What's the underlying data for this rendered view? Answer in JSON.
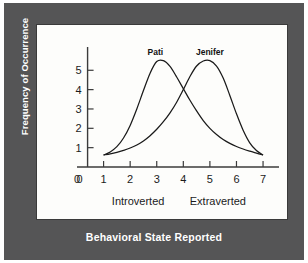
{
  "figure": {
    "title": "Behavioral State Reported",
    "panel_background": "#fdfdfb",
    "mount_color": "#555556",
    "title_color": "#ffffff"
  },
  "chart_data": {
    "type": "line",
    "title": "Behavioral State Reported",
    "xlabel": "Behavioral State Reported",
    "ylabel": "Frequency of Occurrence",
    "xlim": [
      0,
      7.6
    ],
    "ylim": [
      0,
      6.1
    ],
    "grid": false,
    "legend": "inline-labels-above-peaks",
    "xticks": [
      "0",
      "1",
      "2",
      "3",
      "4",
      "5",
      "6",
      "7"
    ],
    "xtick_values": [
      0,
      1,
      2,
      3,
      4,
      5,
      6,
      7
    ],
    "yticks": [
      "0",
      "1",
      "2",
      "3",
      "4",
      "5"
    ],
    "ytick_values": [
      0,
      1,
      2,
      3,
      4,
      5
    ],
    "x_category_labels": [
      {
        "text": "Introverted",
        "at_x": 2.3
      },
      {
        "text": "Extraverted",
        "at_x": 5.3
      }
    ],
    "x": [
      1.0,
      1.25,
      1.5,
      1.75,
      2.0,
      2.25,
      2.5,
      2.75,
      3.0,
      3.25,
      3.5,
      3.75,
      4.0,
      4.25,
      4.5,
      4.75,
      5.0,
      5.25,
      5.5,
      5.75,
      6.0,
      6.25,
      6.5,
      6.75,
      7.0
    ],
    "series": [
      {
        "name": "Pati",
        "label_x": 2.95,
        "label_y": 6.0,
        "peak_x": 3.0,
        "peak_y": 5.5,
        "values": [
          0.62,
          0.78,
          1.05,
          1.5,
          2.15,
          3.0,
          3.95,
          4.85,
          5.45,
          5.5,
          5.2,
          4.65,
          4.05,
          3.45,
          2.9,
          2.4,
          2.0,
          1.68,
          1.42,
          1.22,
          1.06,
          0.93,
          0.82,
          0.72,
          0.62
        ]
      },
      {
        "name": "Jenifer",
        "label_x": 5.0,
        "label_y": 6.0,
        "peak_x": 5.0,
        "peak_y": 5.5,
        "values": [
          0.62,
          0.68,
          0.76,
          0.86,
          0.98,
          1.14,
          1.35,
          1.62,
          1.95,
          2.34,
          2.8,
          3.35,
          4.0,
          4.68,
          5.22,
          5.48,
          5.5,
          5.22,
          4.6,
          3.7,
          2.75,
          1.9,
          1.25,
          0.85,
          0.62
        ]
      }
    ],
    "crossing_point": {
      "x": 4.05,
      "y": 4.05
    }
  }
}
